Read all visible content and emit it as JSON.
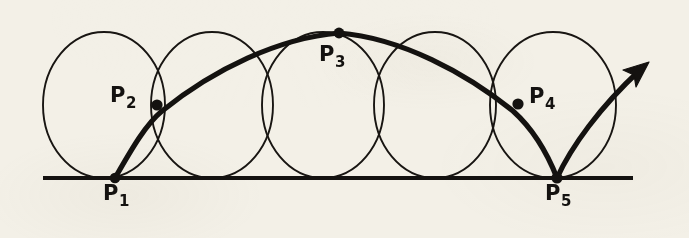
{
  "figure": {
    "kind": "geometric-diagram",
    "background_color": "#f3f0e7",
    "ink_color": "#141210",
    "labels": [
      {
        "name": "point-label-p1",
        "base": "P",
        "subscript": "1",
        "x": 104,
        "y": 183
      },
      {
        "name": "point-label-p2",
        "base": "P",
        "subscript": "2",
        "x": 110,
        "y": 85
      },
      {
        "name": "point-label-p3",
        "base": "P",
        "subscript": "3",
        "x": 319,
        "y": 44
      },
      {
        "name": "point-label-p4",
        "base": "P",
        "subscript": "4",
        "x": 529,
        "y": 86
      },
      {
        "name": "point-label-p5",
        "base": "P",
        "subscript": "5",
        "x": 545,
        "y": 183
      }
    ],
    "points": [
      {
        "name": "point-p1",
        "label": "P1",
        "cx": 115,
        "cy": 178,
        "r": 5.2
      },
      {
        "name": "point-p2",
        "label": "P2",
        "cx": 157,
        "cy": 105,
        "r": 5.2
      },
      {
        "name": "point-p3",
        "label": "P3",
        "cx": 339,
        "cy": 33,
        "r": 5.2
      },
      {
        "name": "point-p4",
        "label": "P4",
        "cx": 518,
        "cy": 104,
        "r": 5.2
      },
      {
        "name": "point-p5",
        "label": "P5",
        "cx": 557,
        "cy": 178,
        "r": 5.2
      }
    ],
    "baseline": {
      "name": "ground-line",
      "x1": 43,
      "y1": 178,
      "x2": 633,
      "y2": 178,
      "width": 4.2
    },
    "circles": [
      {
        "name": "circle-1",
        "cx": 104,
        "cy": 105,
        "rx": 61,
        "ry": 73
      },
      {
        "name": "circle-2",
        "cx": 212,
        "cy": 105,
        "rx": 61,
        "ry": 73
      },
      {
        "name": "circle-3",
        "cx": 323,
        "cy": 105,
        "rx": 61,
        "ry": 73
      },
      {
        "name": "circle-4",
        "cx": 435,
        "cy": 105,
        "rx": 61,
        "ry": 73
      },
      {
        "name": "circle-5",
        "cx": 553,
        "cy": 105,
        "rx": 63,
        "ry": 73
      }
    ],
    "trajectory": {
      "name": "trajectory-arc",
      "path": "M 115,178 C 131,150 147,123 163,110 C 215,70 280,38 339,33 C 400,38 465,72 512,110 C 532,128 547,155 557,178",
      "width": 5.2
    },
    "rebound": {
      "name": "rebound-arc",
      "path": "M 557,178 C 572,148 600,108 641,69",
      "width": 5.2,
      "arrowhead": {
        "name": "arrow-head",
        "tip_x": 648,
        "tip_y": 63
      }
    }
  }
}
